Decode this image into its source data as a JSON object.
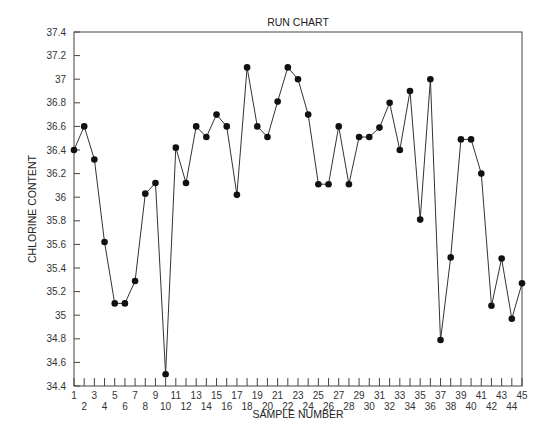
{
  "chart_data": {
    "type": "line",
    "title": "RUN CHART",
    "xlabel": "SAMPLE NUMBER",
    "ylabel": "CHLORINE CONTENT",
    "x": [
      1,
      2,
      3,
      4,
      5,
      6,
      7,
      8,
      9,
      10,
      11,
      12,
      13,
      14,
      15,
      16,
      17,
      18,
      19,
      20,
      21,
      22,
      23,
      24,
      25,
      26,
      27,
      28,
      29,
      30,
      31,
      32,
      33,
      34,
      35,
      36,
      37,
      38,
      39,
      40,
      41,
      42,
      43,
      44,
      45
    ],
    "series": [
      {
        "name": "Chlorine content",
        "values": [
          36.4,
          36.6,
          36.32,
          35.62,
          35.1,
          35.1,
          35.29,
          36.03,
          36.12,
          34.5,
          36.42,
          36.12,
          36.6,
          36.51,
          36.7,
          36.6,
          36.02,
          37.1,
          36.6,
          36.51,
          36.81,
          37.1,
          37.0,
          36.7,
          36.11,
          36.11,
          36.6,
          36.11,
          36.51,
          36.51,
          36.59,
          36.8,
          36.4,
          36.9,
          35.81,
          37.0,
          34.79,
          35.49,
          36.49,
          36.49,
          36.2,
          35.08,
          35.48,
          34.97,
          35.27
        ]
      }
    ],
    "ylim": [
      34.4,
      37.4
    ],
    "xlim": [
      1,
      45
    ],
    "yticks": [
      "34.4",
      "34.6",
      "34.8",
      "35",
      "35.2",
      "35.4",
      "35.6",
      "35.8",
      "36",
      "36.2",
      "36.4",
      "36.6",
      "36.8",
      "37",
      "37.2",
      "37.4"
    ],
    "xticks_odd": [
      "1",
      "3",
      "5",
      "7",
      "9",
      "11",
      "13",
      "15",
      "17",
      "19",
      "21",
      "23",
      "25",
      "27",
      "29",
      "31",
      "33",
      "35",
      "37",
      "39",
      "41",
      "43",
      "45"
    ],
    "xticks_even": [
      "2",
      "4",
      "6",
      "8",
      "10",
      "12",
      "14",
      "16",
      "18",
      "20",
      "22",
      "24",
      "26",
      "28",
      "30",
      "32",
      "34",
      "36",
      "38",
      "40",
      "42",
      "44"
    ],
    "grid": false,
    "legend": "none",
    "marker": "filled-circle",
    "line_color": "#333333",
    "marker_color": "#111111"
  }
}
